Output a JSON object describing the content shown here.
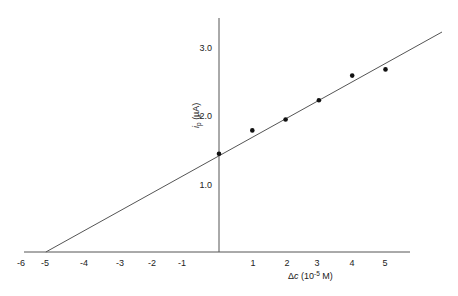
{
  "chart_data": {
    "type": "scatter",
    "title": "",
    "xlabel": "Δc (10⁻⁵ M)",
    "xlabel_parts": {
      "delta": "Δ",
      "var": "c",
      "base": " (10",
      "exp": "-5",
      "unit": " M)"
    },
    "ylabel": "ip (µA)",
    "ylabel_parts": {
      "var": "i",
      "sub": "p",
      "unit": " (µA)"
    },
    "xlim": [
      -6,
      5.6
    ],
    "ylim": [
      0,
      3.4
    ],
    "grid": false,
    "legend": null,
    "x_ticks": [
      {
        "value": -6,
        "label": "-6"
      },
      {
        "value": -5,
        "label": "-5"
      },
      {
        "value": -4,
        "label": "-4"
      },
      {
        "value": -3,
        "label": "-3"
      },
      {
        "value": -2,
        "label": "-2"
      },
      {
        "value": -1,
        "label": "-1"
      },
      {
        "value": 1,
        "label": "1"
      },
      {
        "value": 2,
        "label": "2"
      },
      {
        "value": 3,
        "label": "3"
      },
      {
        "value": 4,
        "label": "4"
      },
      {
        "value": 5,
        "label": "5"
      }
    ],
    "y_ticks": [
      {
        "value": 1.0,
        "label": "1.0"
      },
      {
        "value": 2.0,
        "label": "2.0"
      },
      {
        "value": 3.0,
        "label": "3.0"
      }
    ],
    "series": [
      {
        "name": "measured",
        "kind": "points",
        "x": [
          0,
          1,
          2,
          3,
          4,
          5
        ],
        "y": [
          1.45,
          1.79,
          1.95,
          2.23,
          2.59,
          2.68
        ]
      },
      {
        "name": "standard-addition fit",
        "kind": "line",
        "x": [
          -5.2,
          6.6
        ],
        "y": [
          0.0,
          3.0
        ]
      }
    ],
    "annotations": [
      {
        "text": "x-intercept ≈ -5.2",
        "implied": true
      }
    ]
  }
}
